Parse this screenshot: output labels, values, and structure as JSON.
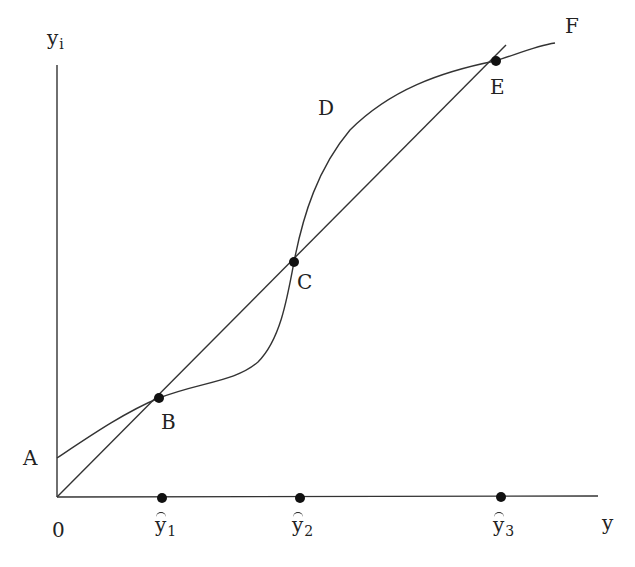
{
  "figure": {
    "type": "economic-diagram",
    "axes": {
      "y_axis_label": {
        "base": "y",
        "subscript": "i"
      },
      "x_axis_label": "y",
      "origin_label": "0"
    },
    "points": {
      "A": "A",
      "B": "B",
      "C": "C",
      "D": "D",
      "E": "E",
      "F": "F"
    },
    "x_axis_markers": [
      {
        "base": "y",
        "subscript": "1",
        "tilde": true
      },
      {
        "base": "y",
        "subscript": "2",
        "tilde": true
      },
      {
        "base": "y",
        "subscript": "3",
        "tilde": true
      }
    ],
    "elements": {
      "straight_line": "45-degree-like ray from origin through B, C, E",
      "curve": "S-shaped curve from A through B, C, D region, E to F"
    },
    "colors": {
      "line": "#333333",
      "dot": "#111111",
      "background": "#ffffff"
    }
  }
}
